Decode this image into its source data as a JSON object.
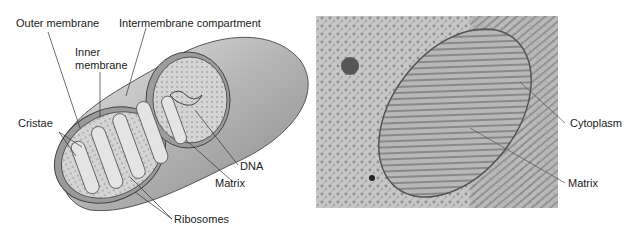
{
  "diagram": {
    "left_panel": {
      "type": "illustration",
      "subject": "Mitochondrion cutaway",
      "labels": {
        "outer_membrane": "Outer membrane",
        "intermembrane": "Intermembrane compartment",
        "inner_membrane_1": "Inner",
        "inner_membrane_2": "membrane",
        "cristae": "Cristae",
        "dna": "DNA",
        "matrix": "Matrix",
        "ribosomes": "Ribosomes"
      }
    },
    "right_panel": {
      "type": "electron-micrograph",
      "labels": {
        "cytoplasm": "Cytoplasm",
        "matrix": "Matrix"
      }
    }
  }
}
